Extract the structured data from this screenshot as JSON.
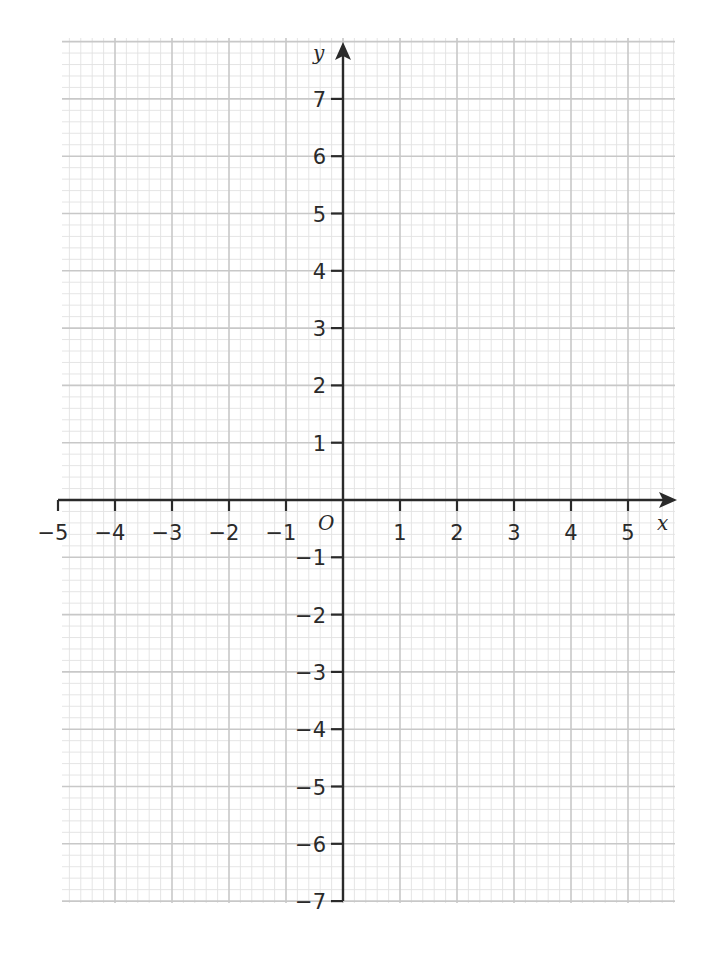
{
  "chart_data": {
    "type": "line",
    "title": "",
    "xlabel": "x",
    "ylabel": "y",
    "origin_label": "O",
    "xlim": [
      -5,
      5
    ],
    "ylim": [
      -7,
      7
    ],
    "x_ticks": [
      -5,
      -4,
      -3,
      -2,
      -1,
      1,
      2,
      3,
      4,
      5
    ],
    "y_ticks": [
      7,
      6,
      5,
      4,
      3,
      2,
      1,
      -1,
      -2,
      -3,
      -4,
      -5,
      -6,
      -7
    ],
    "x_tick_labels": [
      "−5",
      "−4",
      "−3",
      "−2",
      "−1",
      "1",
      "2",
      "3",
      "4",
      "5"
    ],
    "y_tick_labels": [
      "7",
      "6",
      "5",
      "4",
      "3",
      "2",
      "1",
      "−1",
      "−2",
      "−3",
      "−4",
      "−5",
      "−6",
      "−7"
    ],
    "grid": true,
    "grid_style": "graph paper: major lines every 1 unit, minor lines every 0.2 units",
    "series": [],
    "legend": null
  },
  "colors": {
    "axis": "#2a2a2a",
    "grid_major": "#c8c8c8",
    "grid_minor": "#e2e2e2",
    "background": "#ffffff"
  }
}
